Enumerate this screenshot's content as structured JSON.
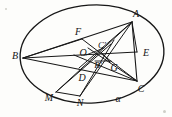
{
  "figure": {
    "type": "geometry-diagram",
    "width": 172,
    "height": 117,
    "background_color": "#fdfdfb",
    "stroke_color": "#171717",
    "label_color": "#141414"
  },
  "conic": {
    "name": "ellipse",
    "label": "α",
    "label_point": {
      "x": 118,
      "y": 99
    },
    "center": {
      "x": 92,
      "y": 54
    },
    "radius_x": 72,
    "radius_y": 49,
    "rotation_deg": -4
  },
  "points": [
    {
      "id": "A",
      "label": "A",
      "x": 136,
      "y": 14,
      "vertex": {
        "x": 132,
        "y": 22
      }
    },
    {
      "id": "B",
      "label": "B",
      "x": 15,
      "y": 56,
      "vertex": {
        "x": 23,
        "y": 58
      }
    },
    {
      "id": "C",
      "label": "C",
      "x": 141,
      "y": 89,
      "vertex": {
        "x": 137,
        "y": 81
      }
    },
    {
      "id": "E",
      "label": "E",
      "x": 146,
      "y": 53,
      "vertex": {
        "x": 137,
        "y": 52
      }
    },
    {
      "id": "F",
      "label": "F",
      "x": 78,
      "y": 32,
      "vertex": {
        "x": 82,
        "y": 39
      }
    },
    {
      "id": "O",
      "label": "O",
      "x": 83,
      "y": 53,
      "vertex": {
        "x": 90,
        "y": 56
      }
    },
    {
      "id": "Cp",
      "label": "C′",
      "x": 102,
      "y": 45,
      "vertex": {
        "x": 101,
        "y": 52
      }
    },
    {
      "id": "Bp",
      "label": "B′",
      "x": 98,
      "y": 65,
      "vertex": {
        "x": 97,
        "y": 59
      }
    },
    {
      "id": "G",
      "label": "G",
      "x": 114,
      "y": 68,
      "vertex": {
        "x": 110,
        "y": 62
      }
    },
    {
      "id": "D",
      "label": "D",
      "x": 82,
      "y": 78,
      "vertex": {
        "x": 86,
        "y": 72
      }
    },
    {
      "id": "M",
      "label": "M",
      "x": 49,
      "y": 98,
      "vertex": {
        "x": 56,
        "y": 92
      }
    },
    {
      "id": "N",
      "label": "N",
      "x": 80,
      "y": 103,
      "vertex": {
        "x": 80,
        "y": 96
      }
    }
  ],
  "segments": [
    {
      "name": "B-A",
      "from": "B",
      "to": "A"
    },
    {
      "name": "B-E",
      "from": "B",
      "to": "E"
    },
    {
      "name": "B-C",
      "from": "B",
      "to": "C"
    },
    {
      "name": "A-C",
      "from": "A",
      "to": "C"
    },
    {
      "name": "A-E",
      "from": "A",
      "to": "E"
    },
    {
      "name": "A-Bp",
      "from": "A",
      "to": "Bp"
    },
    {
      "name": "A-D",
      "from": "A",
      "to": "D"
    },
    {
      "name": "A-M",
      "from": "A",
      "to": "M"
    },
    {
      "name": "A-N",
      "from": "A",
      "to": "N"
    },
    {
      "name": "C-Cp",
      "from": "C",
      "to": "Cp"
    },
    {
      "name": "C-O",
      "from": "C",
      "to": "O"
    },
    {
      "name": "F-C",
      "from": "F",
      "to": "C"
    },
    {
      "name": "M-Cp",
      "from": "M",
      "to": "Cp"
    },
    {
      "name": "N-Cp",
      "from": "N",
      "to": "Cp"
    },
    {
      "name": "O-G",
      "from": "O",
      "to": "G"
    },
    {
      "name": "Cp-G",
      "from": "Cp",
      "to": "G"
    }
  ]
}
